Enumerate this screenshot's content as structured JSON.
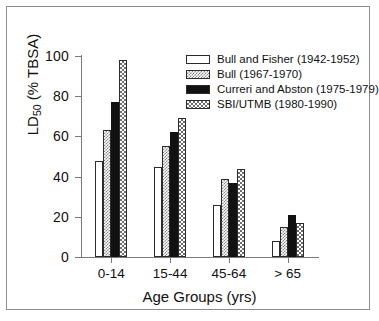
{
  "chart_data": {
    "type": "bar",
    "title": "",
    "xlabel": "Age Groups (yrs)",
    "ylabel": "LD50 (% TBSA)",
    "ylabel_base": "LD",
    "ylabel_sub": "50",
    "ylabel_rest": " (% TBSA)",
    "categories": [
      "0-14",
      "15-44",
      "45-64",
      "> 65"
    ],
    "ylim": [
      0,
      100
    ],
    "yticks": [
      0,
      20,
      40,
      60,
      80,
      100
    ],
    "grid": false,
    "legend_position": "top-right",
    "series": [
      {
        "name": "Bull and Fisher (1942-1952)",
        "swatch": "white",
        "values": [
          48,
          45,
          26,
          8
        ]
      },
      {
        "name": "Bull (1967-1970)",
        "swatch": "dot1",
        "values": [
          63,
          55,
          39,
          15
        ]
      },
      {
        "name": "Curreri and Abston (1975-1979)",
        "swatch": "black",
        "values": [
          77,
          62,
          37,
          21
        ]
      },
      {
        "name": "SBI/UTMB (1980-1990)",
        "swatch": "dot2",
        "values": [
          98,
          69,
          44,
          17
        ]
      }
    ]
  },
  "colors": {
    "axis": "#7a7a7a",
    "frame": "#8d8d8d",
    "text": "#111111",
    "bar_outline": "#2b2b2b",
    "background": "#ffffff"
  }
}
